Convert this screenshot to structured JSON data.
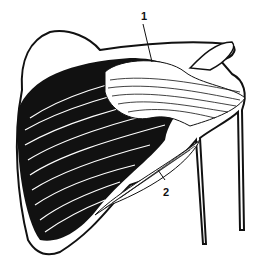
{
  "figure": {
    "labels": [
      {
        "id": "label-1",
        "text": "1",
        "x": 141,
        "y": 14
      },
      {
        "id": "label-2",
        "text": "2",
        "x": 163,
        "y": 191
      }
    ],
    "colors": {
      "ink": "#111111",
      "paper": "#ffffff"
    }
  }
}
